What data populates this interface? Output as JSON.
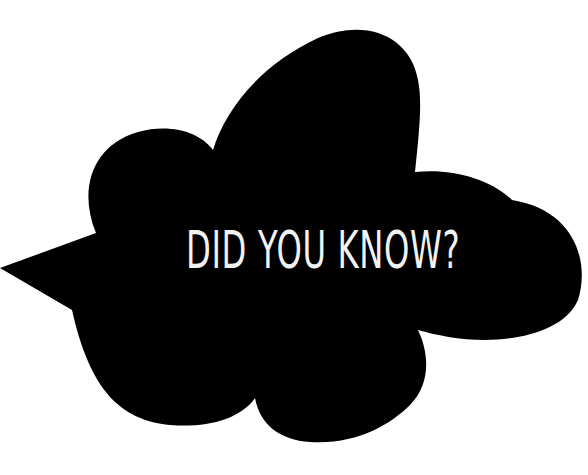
{
  "bubble": {
    "shape": "cloud-speech-bubble",
    "tail_direction": "left",
    "fill_color": "#000000",
    "text": "DID YOU KNOW?",
    "text_color": "#f2f2f2"
  },
  "background_color": "#ffffff"
}
